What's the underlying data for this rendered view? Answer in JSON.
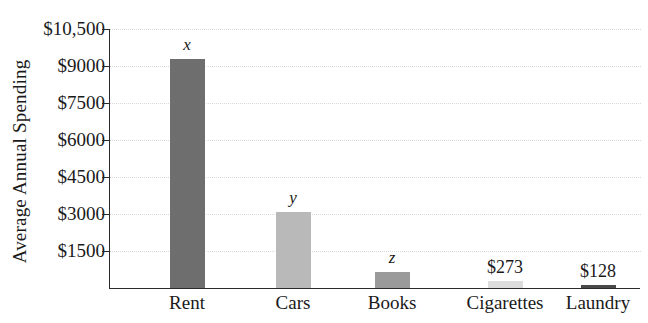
{
  "chart_data": {
    "type": "bar",
    "title": "",
    "xlabel": "",
    "ylabel": "Average Annual Spending",
    "categories": [
      "Rent",
      "Cars",
      "Books",
      "Cigarettes",
      "Laundry"
    ],
    "values": [
      9300,
      3100,
      650,
      273,
      128
    ],
    "point_labels": [
      "x",
      "y",
      "z",
      "$273",
      "$128"
    ],
    "point_label_styles": [
      "italic",
      "italic",
      "italic",
      "normal",
      "normal"
    ],
    "bar_colors": [
      "#6e6e6e",
      "#b9b9b9",
      "#9a9a9a",
      "#dcdcdc",
      "#4a4a4a"
    ],
    "ylim": [
      0,
      10500
    ],
    "ytick_values": [
      1500,
      3000,
      4500,
      6000,
      7500,
      9000,
      10500
    ],
    "ytick_labels": [
      "$1500",
      "$3000",
      "$4500",
      "$6000",
      "$7500",
      "$9000",
      "$10,500"
    ],
    "grid": true,
    "grid_axis": "y",
    "legend": "none"
  }
}
